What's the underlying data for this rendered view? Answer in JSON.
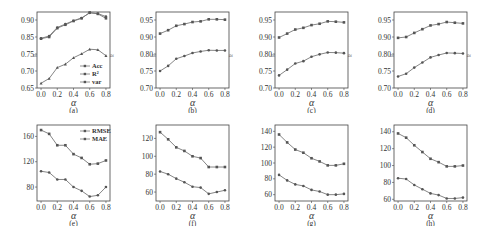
{
  "figure": {
    "panels_top_ylabel_note": "",
    "x_label": "α"
  },
  "chart_data": [
    {
      "id": "a",
      "caption": "(a)",
      "type": "line",
      "x": [
        0.0,
        0.1,
        0.2,
        0.3,
        0.4,
        0.5,
        0.6,
        0.7,
        0.8
      ],
      "xticks": [
        "0.0",
        "0.2",
        "0.4",
        "0.6",
        "0.8"
      ],
      "xlabel": "α",
      "ylim": [
        0.65,
        0.925
      ],
      "yticks": [
        0.65,
        0.7,
        0.75,
        0.85,
        0.9
      ],
      "yticklabels": [
        "0.65",
        "0.70",
        "0.75",
        "0.85",
        "0.90"
      ],
      "axis_break": true,
      "legend": {
        "position": "lower right",
        "entries": [
          "Acc",
          "R²",
          "var"
        ]
      },
      "series": [
        {
          "name": "Acc",
          "values": [
            0.84,
            0.85,
            0.876,
            0.886,
            0.897,
            0.905,
            0.922,
            0.918,
            0.905
          ]
        },
        {
          "name": "R²",
          "values": [
            0.842,
            0.853,
            0.878,
            0.888,
            0.898,
            0.906,
            0.921,
            0.919,
            0.91
          ]
        },
        {
          "name": "var",
          "values": [
            0.664,
            0.678,
            0.71,
            0.72,
            0.739,
            0.751,
            0.778,
            0.775,
            0.745
          ]
        }
      ]
    },
    {
      "id": "b",
      "caption": "(b)",
      "type": "line",
      "x": [
        0.0,
        0.1,
        0.2,
        0.3,
        0.4,
        0.5,
        0.6,
        0.7,
        0.8
      ],
      "xticks": [
        "0.0",
        "0.2",
        "0.4",
        "0.6",
        "0.8"
      ],
      "xlabel": "α",
      "ylim": [
        0.7,
        0.975
      ],
      "yticks": [
        0.7,
        0.75,
        0.8,
        0.9,
        0.95
      ],
      "yticklabels": [
        "0.70",
        "0.75",
        "0.80",
        "0.90",
        "0.95"
      ],
      "axis_break": true,
      "series": [
        {
          "name": "Acc",
          "values": [
            0.91,
            0.92,
            0.933,
            0.938,
            0.944,
            0.946,
            0.952,
            0.952,
            0.951
          ]
        },
        {
          "name": "var",
          "values": [
            0.75,
            0.765,
            0.786,
            0.794,
            0.806,
            0.815,
            0.822,
            0.821,
            0.821
          ]
        }
      ]
    },
    {
      "id": "c",
      "caption": "(c)",
      "type": "line",
      "x": [
        0.0,
        0.1,
        0.2,
        0.3,
        0.4,
        0.5,
        0.6,
        0.7,
        0.8
      ],
      "xticks": [
        "0.0",
        "0.2",
        "0.4",
        "0.6",
        "0.8"
      ],
      "xlabel": "α",
      "ylim": [
        0.7,
        0.975
      ],
      "yticks": [
        0.7,
        0.75,
        0.8,
        0.9,
        0.95
      ],
      "yticklabels": [
        "0.70",
        "0.75",
        "0.80",
        "0.90",
        "0.95"
      ],
      "axis_break": true,
      "series": [
        {
          "name": "Acc",
          "values": [
            0.897,
            0.91,
            0.922,
            0.927,
            0.935,
            0.939,
            0.946,
            0.945,
            0.943
          ]
        },
        {
          "name": "var",
          "values": [
            0.737,
            0.754,
            0.772,
            0.779,
            0.792,
            0.799,
            0.809,
            0.808,
            0.805
          ]
        }
      ]
    },
    {
      "id": "d",
      "caption": "(d)",
      "type": "line",
      "x": [
        0.0,
        0.1,
        0.2,
        0.3,
        0.4,
        0.5,
        0.6,
        0.7,
        0.8
      ],
      "xticks": [
        "0.0",
        "0.2",
        "0.4",
        "0.6",
        "0.8"
      ],
      "xlabel": "α",
      "ylim": [
        0.7,
        0.975
      ],
      "yticks": [
        0.7,
        0.75,
        0.8,
        0.9,
        0.95
      ],
      "yticklabels": [
        "0.70",
        "0.75",
        "0.80",
        "0.90",
        "0.95"
      ],
      "axis_break": true,
      "series": [
        {
          "name": "Acc",
          "values": [
            0.895,
            0.9,
            0.912,
            0.923,
            0.934,
            0.938,
            0.944,
            0.942,
            0.94
          ]
        },
        {
          "name": "var",
          "values": [
            0.734,
            0.742,
            0.76,
            0.775,
            0.79,
            0.797,
            0.806,
            0.805,
            0.803
          ]
        }
      ]
    },
    {
      "id": "e",
      "caption": "(e)",
      "type": "line",
      "x": [
        0.0,
        0.1,
        0.2,
        0.3,
        0.4,
        0.5,
        0.6,
        0.7,
        0.8
      ],
      "xticks": [
        "0.0",
        "0.2",
        "0.4",
        "0.6",
        "0.8"
      ],
      "xlabel": "α",
      "ylim": [
        58,
        178
      ],
      "yticks": [
        80,
        120,
        160
      ],
      "yticklabels": [
        "80",
        "120",
        "160"
      ],
      "legend": {
        "position": "upper right",
        "entries": [
          "RMSE",
          "MAE"
        ]
      },
      "series": [
        {
          "name": "RMSE",
          "values": [
            170,
            164,
            146,
            146,
            132,
            126,
            116,
            117,
            122
          ]
        },
        {
          "name": "MAE",
          "values": [
            105,
            103,
            92,
            92,
            80,
            74,
            65,
            67,
            80
          ]
        }
      ]
    },
    {
      "id": "f",
      "caption": "(f)",
      "type": "line",
      "x": [
        0.0,
        0.1,
        0.2,
        0.3,
        0.4,
        0.5,
        0.6,
        0.7,
        0.8
      ],
      "xticks": [
        "0.0",
        "0.2",
        "0.4",
        "0.6",
        "0.8"
      ],
      "xlabel": "α",
      "ylim": [
        50,
        135
      ],
      "yticks": [
        60,
        80,
        100,
        120
      ],
      "yticklabels": [
        "60",
        "80",
        "100",
        "120"
      ],
      "series": [
        {
          "name": "RMSE",
          "values": [
            127,
            119,
            110,
            106,
            100,
            98,
            88,
            88,
            88
          ]
        },
        {
          "name": "MAE",
          "values": [
            83,
            80,
            75,
            71,
            66,
            65,
            58,
            60,
            62
          ]
        }
      ]
    },
    {
      "id": "g",
      "caption": "(g)",
      "type": "line",
      "x": [
        0.0,
        0.1,
        0.2,
        0.3,
        0.4,
        0.5,
        0.6,
        0.7,
        0.8
      ],
      "xticks": [
        "0.0",
        "0.2",
        "0.4",
        "0.6",
        "0.8"
      ],
      "xlabel": "α",
      "ylim": [
        52,
        148
      ],
      "yticks": [
        60,
        80,
        100,
        120,
        140
      ],
      "yticklabels": [
        "60",
        "80",
        "100",
        "120",
        "140"
      ],
      "series": [
        {
          "name": "RMSE",
          "values": [
            136,
            126,
            117,
            113,
            106,
            102,
            97,
            97,
            99
          ]
        },
        {
          "name": "MAE",
          "values": [
            85,
            78,
            73,
            71,
            66,
            64,
            60,
            60,
            61
          ]
        }
      ]
    },
    {
      "id": "h",
      "caption": "(h)",
      "type": "line",
      "x": [
        0.0,
        0.1,
        0.2,
        0.3,
        0.4,
        0.5,
        0.6,
        0.7,
        0.8
      ],
      "xticks": [
        "0.0",
        "0.2",
        "0.4",
        "0.6",
        "0.8"
      ],
      "xlabel": "α",
      "ylim": [
        58,
        148
      ],
      "yticks": [
        60,
        80,
        100,
        120,
        140
      ],
      "yticklabels": [
        "60",
        "80",
        "100",
        "120",
        "140"
      ],
      "series": [
        {
          "name": "RMSE",
          "values": [
            138,
            133,
            124,
            116,
            108,
            104,
            99,
            99,
            100
          ]
        },
        {
          "name": "MAE",
          "values": [
            85,
            84,
            77,
            72,
            67,
            65,
            61,
            61,
            62
          ]
        }
      ]
    }
  ],
  "style": {
    "line_color": "#777777",
    "marker_color": "#555555",
    "axis_color": "#444444",
    "text_color": "#333333"
  }
}
